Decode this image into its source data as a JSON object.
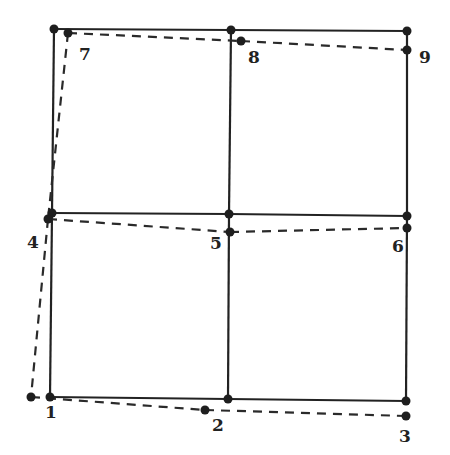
{
  "diagram": {
    "type": "finite-element-mesh-deformation",
    "colors": {
      "line": "#222222",
      "node": "#1e1e1e",
      "background": "#ffffff"
    },
    "original_grid": {
      "style": "solid",
      "nodes": [
        {
          "row": 0,
          "col": 0,
          "x": 54,
          "y": 29
        },
        {
          "row": 0,
          "col": 1,
          "x": 231,
          "y": 30
        },
        {
          "row": 0,
          "col": 2,
          "x": 407,
          "y": 31
        },
        {
          "row": 1,
          "col": 0,
          "x": 52,
          "y": 213
        },
        {
          "row": 1,
          "col": 1,
          "x": 229,
          "y": 214
        },
        {
          "row": 1,
          "col": 2,
          "x": 407,
          "y": 216
        },
        {
          "row": 2,
          "col": 0,
          "x": 50,
          "y": 397
        },
        {
          "row": 2,
          "col": 1,
          "x": 228,
          "y": 399
        },
        {
          "row": 2,
          "col": 2,
          "x": 406,
          "y": 401
        }
      ]
    },
    "deformed_grid": {
      "style": "dashed",
      "nodes": [
        {
          "id": "1",
          "label": "1",
          "x": 31,
          "y": 397,
          "label_x": 51,
          "label_y": 418
        },
        {
          "id": "2",
          "label": "2",
          "x": 205,
          "y": 410,
          "label_x": 218,
          "label_y": 431
        },
        {
          "id": "3",
          "label": "3",
          "x": 406,
          "y": 416,
          "label_x": 405,
          "label_y": 442
        },
        {
          "id": "4",
          "label": "4",
          "x": 48,
          "y": 219,
          "label_x": 33,
          "label_y": 248
        },
        {
          "id": "5",
          "label": "5",
          "x": 230,
          "y": 232,
          "label_x": 216,
          "label_y": 249
        },
        {
          "id": "6",
          "label": "6",
          "x": 407,
          "y": 228,
          "label_x": 398,
          "label_y": 252
        },
        {
          "id": "7",
          "label": "7",
          "x": 68,
          "y": 33,
          "label_x": 85,
          "label_y": 60
        },
        {
          "id": "8",
          "label": "8",
          "x": 241,
          "y": 41,
          "label_x": 254,
          "label_y": 63
        },
        {
          "id": "9",
          "label": "9",
          "x": 407,
          "y": 50,
          "label_x": 425,
          "label_y": 63
        }
      ],
      "dashed_edges": [
        [
          "7",
          "8"
        ],
        [
          "8",
          "9"
        ],
        [
          "4",
          "5"
        ],
        [
          "5",
          "6"
        ],
        [
          "1",
          "2"
        ],
        [
          "2",
          "3"
        ],
        [
          "7",
          "4"
        ],
        [
          "4",
          "1"
        ]
      ]
    }
  }
}
